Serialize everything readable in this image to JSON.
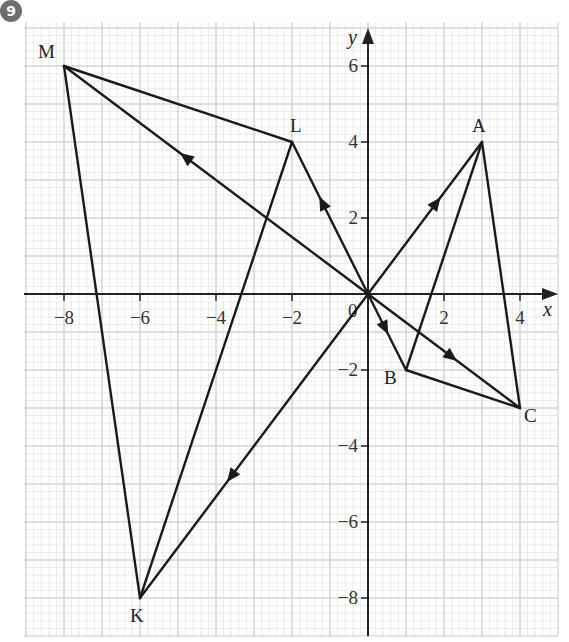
{
  "badge": {
    "number": "9",
    "color": "#6d6e70"
  },
  "axes": {
    "x_label": "x",
    "y_label": "y",
    "origin_label": "0",
    "x_ticks": [
      "-8",
      "-6",
      "-4",
      "-2",
      "2",
      "4"
    ],
    "y_ticks": [
      "6",
      "4",
      "2",
      "-2",
      "-4",
      "-6",
      "-8"
    ]
  },
  "points": [
    {
      "name": "M",
      "x": -8,
      "y": 6
    },
    {
      "name": "L",
      "x": -2,
      "y": 4
    },
    {
      "name": "A",
      "x": 3,
      "y": 4
    },
    {
      "name": "B",
      "x": 1,
      "y": -2
    },
    {
      "name": "C",
      "x": 4,
      "y": -3
    },
    {
      "name": "K",
      "x": -6,
      "y": -8
    }
  ],
  "vectors": [
    {
      "from": "O",
      "to": "M",
      "arrow": true
    },
    {
      "from": "O",
      "to": "L",
      "arrow": true
    },
    {
      "from": "O",
      "to": "A",
      "arrow": true
    },
    {
      "from": "O",
      "to": "B",
      "arrow": true
    },
    {
      "from": "O",
      "to": "C",
      "arrow": true
    },
    {
      "from": "O",
      "to": "K",
      "arrow": true
    }
  ],
  "segments": [
    {
      "from": "M",
      "to": "L"
    },
    {
      "from": "M",
      "to": "K"
    },
    {
      "from": "L",
      "to": "K"
    },
    {
      "from": "A",
      "to": "B"
    },
    {
      "from": "A",
      "to": "C"
    },
    {
      "from": "B",
      "to": "C"
    }
  ],
  "chart_data": {
    "type": "scatter",
    "title": "",
    "xlabel": "x",
    "ylabel": "y",
    "xlim": [
      -9,
      4.6
    ],
    "ylim": [
      -9,
      7
    ],
    "grid": true,
    "series": [
      {
        "name": "points",
        "labels": [
          "M",
          "L",
          "A",
          "B",
          "C",
          "K"
        ],
        "x": [
          -8,
          -2,
          3,
          1,
          4,
          -6
        ],
        "y": [
          6,
          4,
          4,
          -2,
          -3,
          -8
        ]
      }
    ],
    "triangles": [
      [
        "M",
        "L",
        "K"
      ],
      [
        "A",
        "B",
        "C"
      ]
    ],
    "vectors_from_origin": [
      "M",
      "L",
      "A",
      "B",
      "C",
      "K"
    ]
  }
}
